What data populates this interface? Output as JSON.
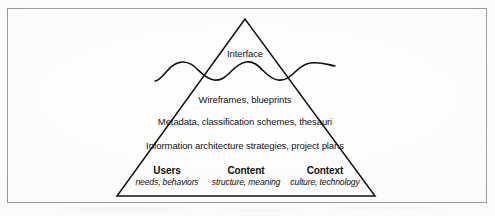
{
  "figure": {
    "kind": "iceberg-pyramid-diagram",
    "frame_color": "#9a9a9a",
    "line_color": "#111111",
    "background_color": "#fefefe",
    "text_color": "#111111"
  },
  "diagram": {
    "apex_label": "Interface",
    "waterline": {
      "name": "waterline-wave",
      "description": "wavy water surface line crossing the pyramid"
    },
    "layers": [
      {
        "label": "Wireframes, blueprints"
      },
      {
        "label": "Metadata, classification schemes, thesauri"
      },
      {
        "label": "Information architecture strategies, project plans"
      }
    ],
    "pillars": [
      {
        "title": "Users",
        "subtitle": "needs, behaviors"
      },
      {
        "title": "Content",
        "subtitle": "structure, meaning"
      },
      {
        "title": "Context",
        "subtitle": "culture, technology"
      }
    ]
  }
}
